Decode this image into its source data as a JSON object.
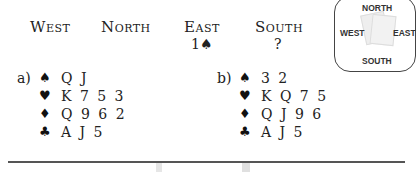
{
  "auction": {
    "headers": [
      "West",
      "North",
      "East",
      "South"
    ],
    "bids": [
      "",
      "",
      "1♠",
      "?"
    ]
  },
  "compass": {
    "north": "NORTH",
    "west": "WEST",
    "east": "EAST",
    "south": "SOUTH"
  },
  "hands": [
    {
      "label": "a)",
      "spades": "Q J",
      "hearts": "K 7 5 3",
      "diamonds": "Q 9 6 2",
      "clubs": "A J 5"
    },
    {
      "label": "b)",
      "spades": "3 2",
      "hearts": "K Q 7 5",
      "diamonds": "Q J 9 6",
      "clubs": "A J 5"
    }
  ],
  "suits": {
    "spade": "♠",
    "heart": "♥",
    "diamond": "♦",
    "club": "♣"
  }
}
